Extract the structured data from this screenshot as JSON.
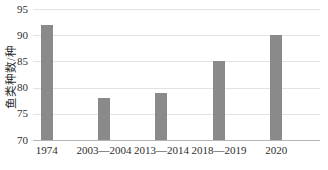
{
  "figure": {
    "background": "#ffffff"
  },
  "chart_data": {
    "type": "bar",
    "categories": [
      "1974",
      "2003—2004",
      "2013—2014",
      "2018—2019",
      "2020"
    ],
    "values": [
      92,
      78,
      79,
      85,
      90
    ],
    "title": "",
    "xlabel": "",
    "ylabel": "鱼类种数/种",
    "ylim": [
      70,
      95
    ],
    "yticks": [
      70,
      75,
      80,
      85,
      90,
      95
    ],
    "grid": true,
    "legend": "none",
    "bar_color": "#8a8a8a",
    "gridline_color": "#e3e3e3",
    "axis_line_color": "#b5b5b5",
    "text_color": "#2e2e2e"
  }
}
